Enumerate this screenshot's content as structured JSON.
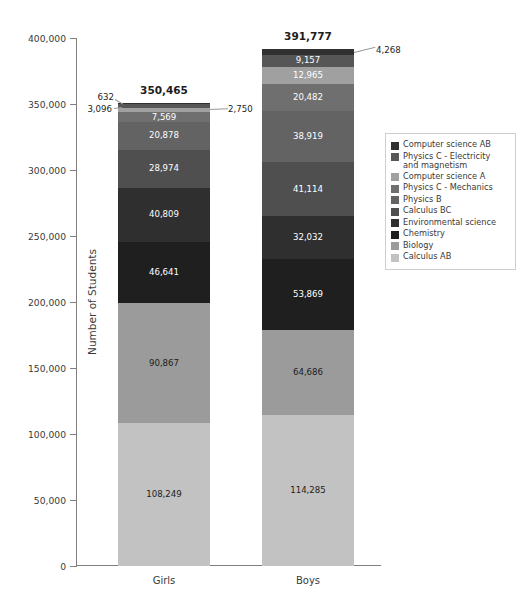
{
  "chart_data": {
    "type": "bar",
    "variant": "stacked-vertical",
    "title": "",
    "xlabel": "",
    "ylabel": "Number of Students",
    "ylim": [
      0,
      400000
    ],
    "ytick_values": [
      0,
      50000,
      100000,
      150000,
      200000,
      250000,
      300000,
      350000,
      400000
    ],
    "ytick_labels": [
      "0",
      "50,000",
      "100,000",
      "150,000",
      "200,000",
      "250,000",
      "300,000",
      "350,000",
      "400,000"
    ],
    "grid": false,
    "legend_position": "right",
    "categories": [
      "Girls",
      "Boys"
    ],
    "series": [
      {
        "name": "Calculus AB",
        "color": "#c2c2c2",
        "values": [
          108249,
          114285
        ],
        "labels": [
          "108,249",
          "114,285"
        ],
        "label_on_dark": [
          false,
          false
        ]
      },
      {
        "name": "Biology",
        "color": "#9b9b9b",
        "values": [
          90867,
          64686
        ],
        "labels": [
          "90,867",
          "64,686"
        ],
        "label_on_dark": [
          false,
          false
        ]
      },
      {
        "name": "Chemistry",
        "color": "#1f1f1f",
        "values": [
          46641,
          53869
        ],
        "labels": [
          "46,641",
          "53,869"
        ],
        "label_on_dark": [
          true,
          true
        ]
      },
      {
        "name": "Environmental science",
        "color": "#2f2f2f",
        "values": [
          40809,
          32032
        ],
        "labels": [
          "40,809",
          "32,032"
        ],
        "label_on_dark": [
          true,
          true
        ]
      },
      {
        "name": "Calculus BC",
        "color": "#4f4f4f",
        "values": [
          28974,
          41114
        ],
        "labels": [
          "28,974",
          "41,114"
        ],
        "label_on_dark": [
          true,
          true
        ]
      },
      {
        "name": "Physics B",
        "color": "#636363",
        "values": [
          20878,
          38919
        ],
        "labels": [
          "20,878",
          "38,919"
        ],
        "label_on_dark": [
          true,
          true
        ]
      },
      {
        "name": "Physics C - Mechanics",
        "color": "#6f6f6f",
        "values": [
          7569,
          20482
        ],
        "labels": [
          "7,569",
          "20,482"
        ],
        "label_on_dark": [
          true,
          true
        ]
      },
      {
        "name": "Computer science A",
        "color": "#a0a0a0",
        "values": [
          2750,
          12965
        ],
        "labels": [
          "2,750",
          "12,965"
        ],
        "label_on_dark": [
          false,
          true
        ]
      },
      {
        "name": "Physics C - Electricity and magnetism",
        "color": "#565656",
        "values": [
          3096,
          9157
        ],
        "labels": [
          "3,096",
          "9,157"
        ],
        "label_on_dark": [
          true,
          true
        ]
      },
      {
        "name": "Computer science AB",
        "color": "#303030",
        "values": [
          632,
          4268
        ],
        "labels": [
          "632",
          "4,268"
        ],
        "label_on_dark": [
          true,
          true
        ]
      }
    ],
    "totals": [
      350465,
      391777
    ],
    "total_labels": [
      "350,465",
      "391,777"
    ],
    "callouts": [
      {
        "text": "632",
        "bar": "Girls",
        "series": "Computer science AB"
      },
      {
        "text": "3,096",
        "bar": "Girls",
        "series": "Physics C - Electricity and magnetism"
      },
      {
        "text": "2,750",
        "bar": "Girls",
        "series": "Computer science A"
      },
      {
        "text": "4,268",
        "bar": "Boys",
        "series": "Computer science AB"
      }
    ]
  },
  "legend": {
    "entries": [
      {
        "label": "Computer science AB",
        "color": "#303030"
      },
      {
        "label": "Physics C - Electricity\n  and magnetism",
        "color": "#565656"
      },
      {
        "label": "Computer science A",
        "color": "#a0a0a0"
      },
      {
        "label": "Physics C - Mechanics",
        "color": "#6f6f6f"
      },
      {
        "label": "Physics B",
        "color": "#636363"
      },
      {
        "label": "Calculus BC",
        "color": "#4f4f4f"
      },
      {
        "label": "Environmental science",
        "color": "#2f2f2f"
      },
      {
        "label": "Chemistry",
        "color": "#1f1f1f"
      },
      {
        "label": "Biology",
        "color": "#9b9b9b"
      },
      {
        "label": "Calculus AB",
        "color": "#c2c2c2"
      }
    ]
  }
}
